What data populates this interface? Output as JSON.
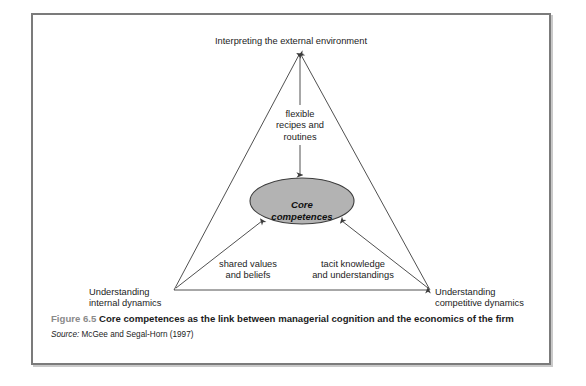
{
  "figure": {
    "diagram": {
      "apex_label": "Interpreting the external environment",
      "center_node": {
        "line1": "Core",
        "line2": "competences",
        "fill_color": "#b3b3b3",
        "stroke_color": "#3c3c3c"
      },
      "vertical_flow_label": {
        "line1": "flexible",
        "line2": "recipes and",
        "line3": "routines"
      },
      "left_flow_label": {
        "line1": "shared values",
        "line2": "and beliefs"
      },
      "right_flow_label": {
        "line1": "tacit knowledge",
        "line2": "and understandings"
      },
      "bottom_left_label": {
        "line1": "Understanding",
        "line2": "internal dynamics"
      },
      "bottom_right_label": {
        "line1": "Understanding",
        "line2": "competitive dynamics"
      },
      "line_color": "#3c3c3c"
    },
    "caption": {
      "figure_number": "Figure 6.5",
      "title": " Core competences as the link between managerial cognition and the economics of the firm",
      "source_label": "Source:",
      "source_text": " McGee and Segal-Horn (1997)"
    }
  }
}
